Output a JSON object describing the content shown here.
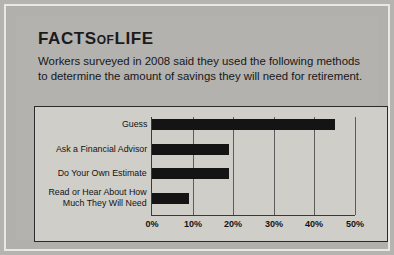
{
  "panel": {
    "title_main": "FACTS",
    "title_mid": "OF",
    "title_end": "LIFE",
    "intro_line1": "Workers surveyed in 2008 said they used the following methods",
    "intro_line2": "to determine the amount of savings they will need for retirement."
  },
  "colors": {
    "background": "#b3b2ae",
    "frame": "#e9e8e4",
    "chart_background": "#cfcec9",
    "bar": "#141414",
    "axis": "#3a3a3a",
    "text": "#131313"
  },
  "chart_data": {
    "type": "bar",
    "orientation": "horizontal",
    "title": "",
    "xlabel": "",
    "ylabel": "",
    "xlim": [
      0,
      50
    ],
    "grid": true,
    "legend": null,
    "xticks": [
      "0%",
      "10%",
      "20%",
      "30%",
      "40%",
      "50%"
    ],
    "xtick_values": [
      0,
      10,
      20,
      30,
      40,
      50
    ],
    "categories": [
      "Guess",
      "Ask a Financial Advisor",
      "Do Your Own Estimate",
      "Read or Hear About How Much They Will Need"
    ],
    "category_lines": [
      [
        "Guess"
      ],
      [
        "Ask a Financial Advisor"
      ],
      [
        "Do Your Own Estimate"
      ],
      [
        "Read or Hear About How",
        "Much They Will Need"
      ]
    ],
    "values": [
      45,
      19,
      19,
      9
    ],
    "value_unit": "%"
  }
}
